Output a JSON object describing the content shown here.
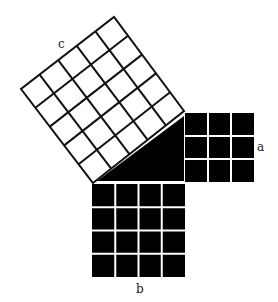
{
  "diagram": {
    "labels": {
      "a": "a",
      "b": "b",
      "c": "c"
    },
    "squares": {
      "a": {
        "grid": 3,
        "fill": "#000000",
        "line": "#ffffff"
      },
      "b": {
        "grid": 4,
        "fill": "#000000",
        "line": "#ffffff"
      },
      "c": {
        "grid": 5,
        "fill": "#ffffff",
        "line": "#111111"
      }
    },
    "triangle": {
      "fill": "#000000"
    },
    "colors": {
      "background": "#ffffff",
      "ink": "#000000"
    }
  }
}
